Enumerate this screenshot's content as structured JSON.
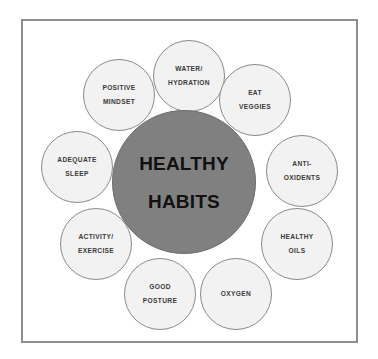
{
  "diagram": {
    "type": "radial-hub-and-spoke",
    "frame": {
      "border_color": "#8e8e8e",
      "background_color": "#ffffff"
    },
    "center": {
      "label_line1": "HEALTHY",
      "label_line2": "HABITS",
      "fill_color": "#808080",
      "text_color": "#111111"
    },
    "petal_style": {
      "fill_color": "#f2f2f2",
      "border_color": "#8a8a8a",
      "text_color": "#3a3a3a"
    },
    "petals": [
      {
        "name": "water-hydration",
        "line1": "WATER/",
        "line2": "HYDRATION",
        "x": 153,
        "y": 40
      },
      {
        "name": "eat-veggies",
        "line1": "EAT",
        "line2": "VEGGIES",
        "x": 219,
        "y": 64
      },
      {
        "name": "anti-oxidents",
        "line1": "ANTI-",
        "line2": "OXIDENTS",
        "x": 266,
        "y": 135
      },
      {
        "name": "healthy-oils",
        "line1": "HEALTHY",
        "line2": "OILS",
        "x": 261,
        "y": 208
      },
      {
        "name": "oxygen",
        "line1": "OXYGEN",
        "line2": "",
        "x": 200,
        "y": 258
      },
      {
        "name": "good-posture",
        "line1": "GOOD",
        "line2": "POSTURE",
        "x": 124,
        "y": 258
      },
      {
        "name": "activity-exercise",
        "line1": "ACTIVITY/",
        "line2": "EXERCISE",
        "x": 60,
        "y": 208
      },
      {
        "name": "adequate-sleep",
        "line1": "ADEQUATE",
        "line2": "SLEEP",
        "x": 41,
        "y": 131
      },
      {
        "name": "positive-mindset",
        "line1": "POSITIVE",
        "line2": "MINDSET",
        "x": 83,
        "y": 59
      }
    ]
  }
}
